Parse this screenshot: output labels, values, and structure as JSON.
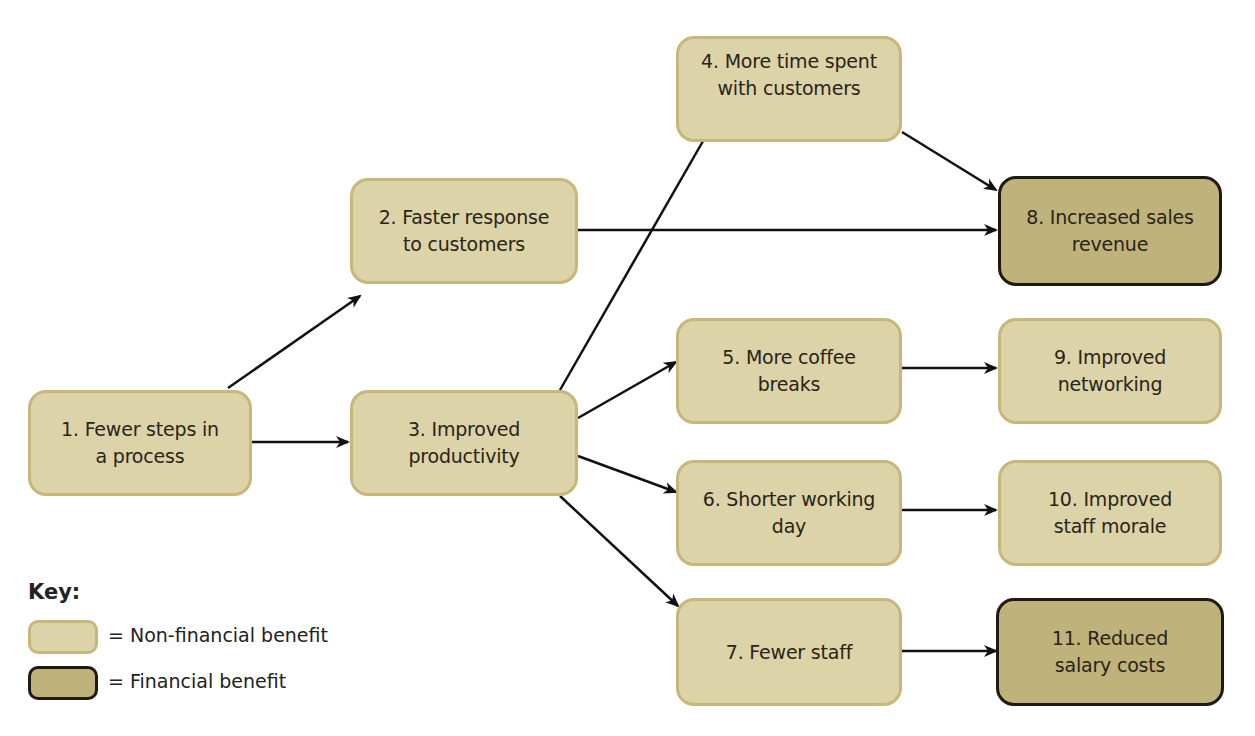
{
  "diagram": {
    "type": "flow",
    "colors": {
      "non_financial_fill": "#dcd3a8",
      "non_financial_border": "#c6b87a",
      "financial_fill": "#bfb27a",
      "financial_border": "#1e1a12",
      "arrow": "#111111"
    },
    "nodes": [
      {
        "id": 1,
        "label": "1. Fewer steps in a process",
        "line1": "1. Fewer steps in",
        "line2": "a process",
        "kind": "non-financial"
      },
      {
        "id": 2,
        "label": "2. Faster response to customers",
        "line1": "2. Faster response",
        "line2": "to customers",
        "kind": "non-financial"
      },
      {
        "id": 3,
        "label": "3. Improved productivity",
        "line1": "3. Improved",
        "line2": "productivity",
        "kind": "non-financial"
      },
      {
        "id": 4,
        "label": "4. More time spent with customers",
        "line1": "4. More time spent",
        "line2": "with customers",
        "kind": "non-financial"
      },
      {
        "id": 5,
        "label": "5. More coffee breaks",
        "line1": "5. More coffee",
        "line2": "breaks",
        "kind": "non-financial"
      },
      {
        "id": 6,
        "label": "6. Shorter working day",
        "line1": "6. Shorter working",
        "line2": "day",
        "kind": "non-financial"
      },
      {
        "id": 7,
        "label": "7. Fewer staff",
        "line1": "7. Fewer staff",
        "line2": "",
        "kind": "non-financial"
      },
      {
        "id": 8,
        "label": "8. Increased sales revenue",
        "line1": "8. Increased sales",
        "line2": "revenue",
        "kind": "financial"
      },
      {
        "id": 9,
        "label": "9. Improved networking",
        "line1": "9. Improved",
        "line2": "networking",
        "kind": "non-financial"
      },
      {
        "id": 10,
        "label": "10. Improved staff morale",
        "line1": "10. Improved",
        "line2": "staff morale",
        "kind": "non-financial"
      },
      {
        "id": 11,
        "label": "11. Reduced salary costs",
        "line1": "11. Reduced",
        "line2": "salary costs",
        "kind": "financial"
      }
    ],
    "edges": [
      {
        "from": 1,
        "to": 2
      },
      {
        "from": 1,
        "to": 3
      },
      {
        "from": 2,
        "to": 8
      },
      {
        "from": 3,
        "to": 4
      },
      {
        "from": 3,
        "to": 5
      },
      {
        "from": 3,
        "to": 6
      },
      {
        "from": 3,
        "to": 7
      },
      {
        "from": 4,
        "to": 8
      },
      {
        "from": 5,
        "to": 9
      },
      {
        "from": 6,
        "to": 10
      },
      {
        "from": 7,
        "to": 11
      }
    ]
  },
  "key": {
    "title": "Key:",
    "items": [
      {
        "label": "= Non-financial benefit",
        "kind": "non-financial"
      },
      {
        "label": "= Financial benefit",
        "kind": "financial"
      }
    ]
  }
}
